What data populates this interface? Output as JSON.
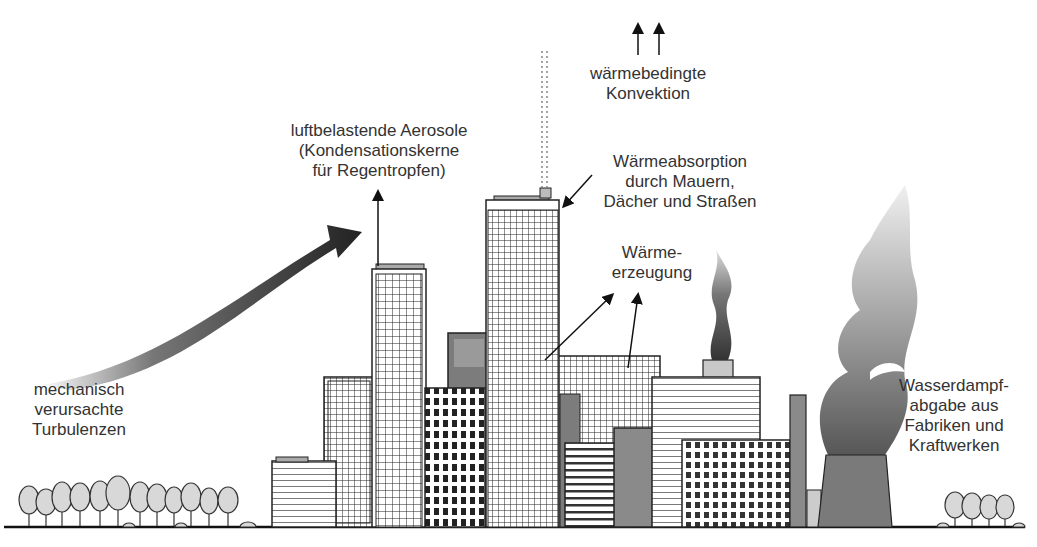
{
  "labels": {
    "convection": [
      "wärmebedingte",
      "Konvektion"
    ],
    "aerosols": [
      "luftbelastende Aerosole",
      "(Kondensationskerne",
      "für Regentropfen)"
    ],
    "absorption": [
      "Wärmeabsorption",
      "durch Mauern,",
      "Dächer und Straßen"
    ],
    "heat_generation": [
      "Wärme-",
      "erzeugung"
    ],
    "turbulence": [
      "mechanisch",
      "verursachte",
      "Turbulenzen"
    ],
    "water_vapor": [
      "Wasserdampf-",
      "abgabe aus",
      "Fabriken und",
      "Kraftwerken"
    ]
  },
  "icons": {
    "convection_arrows": "double-up-arrow-icon",
    "turbulence_arrow": "curved-arrow-icon",
    "aerosol_arrow": "up-arrow-icon",
    "absorption_arrow": "pointer-arrow-icon",
    "heat_arrows": "pointer-arrow-icon"
  },
  "colors": {
    "ink": "#1e1e1e",
    "dark_gray": "#555555",
    "mid_gray": "#8a8a8a",
    "light_gray": "#bdbdbd",
    "background": "#ffffff"
  }
}
